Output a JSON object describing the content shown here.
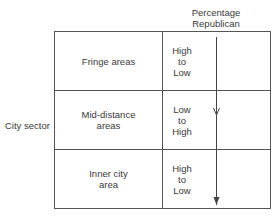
{
  "header": {
    "line1": "Percentage",
    "line2": "Republican"
  },
  "side_label": "City sector",
  "rows": [
    {
      "sector_line1": "Fringe areas",
      "sector_line2": "",
      "trend": [
        "High",
        "to",
        "Low"
      ]
    },
    {
      "sector_line1": "Mid-distance",
      "sector_line2": "areas",
      "trend": [
        "Low",
        "to",
        "High"
      ]
    },
    {
      "sector_line1": "Inner city",
      "sector_line2": "area",
      "trend": [
        "High",
        "to",
        "Low"
      ]
    }
  ],
  "colors": {
    "line": "#555555",
    "text": "#3a3a3a",
    "background": "#ffffff"
  }
}
